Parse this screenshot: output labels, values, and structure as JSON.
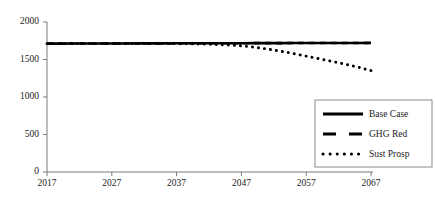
{
  "chart_data": {
    "type": "line",
    "title": "",
    "xlabel": "",
    "ylabel": "",
    "xlim": [
      2017,
      2067
    ],
    "ylim": [
      0,
      2000
    ],
    "grid": false,
    "legend_position": "bottom-right",
    "x_ticks": [
      2017,
      2027,
      2037,
      2047,
      2057,
      2067
    ],
    "x_tick_labels": [
      "2017",
      "2027",
      "2037",
      "2047",
      "2057",
      "2067"
    ],
    "y_ticks": [
      0,
      500,
      1000,
      1500,
      2000
    ],
    "y_tick_labels": [
      "0",
      "500",
      "1000",
      "1500",
      "2000"
    ],
    "x": [
      2017,
      2019,
      2021,
      2023,
      2025,
      2027,
      2029,
      2031,
      2033,
      2035,
      2037,
      2039,
      2041,
      2043,
      2045,
      2047,
      2049,
      2051,
      2053,
      2055,
      2057,
      2059,
      2061,
      2063,
      2065,
      2067
    ],
    "series": [
      {
        "name": "Base Case",
        "style": "solid",
        "color": "#000000",
        "values": [
          1712,
          1712,
          1713,
          1713,
          1714,
          1714,
          1714,
          1715,
          1715,
          1715,
          1716,
          1716,
          1716,
          1717,
          1717,
          1717,
          1718,
          1718,
          1718,
          1719,
          1719,
          1719,
          1720,
          1720,
          1720,
          1721
        ]
      },
      {
        "name": "GHG Red",
        "style": "dashed",
        "color": "#000000",
        "values": [
          1712,
          1712,
          1713,
          1713,
          1714,
          1714,
          1714,
          1715,
          1715,
          1715,
          1716,
          1716,
          1716,
          1717,
          1717,
          1717,
          1718,
          1718,
          1718,
          1719,
          1719,
          1719,
          1720,
          1720,
          1720,
          1721
        ]
      },
      {
        "name": "Sust Prosp",
        "style": "dotted",
        "color": "#000000",
        "values": [
          1711,
          1711,
          1712,
          1712,
          1712,
          1713,
          1713,
          1713,
          1713,
          1712,
          1711,
          1709,
          1706,
          1701,
          1693,
          1682,
          1664,
          1640,
          1612,
          1580,
          1545,
          1510,
          1475,
          1438,
          1398,
          1352
        ]
      }
    ]
  },
  "legend": {
    "items": [
      {
        "label": "Base Case",
        "style": "solid"
      },
      {
        "label": "GHG Red",
        "style": "dashed"
      },
      {
        "label": "Sust Prosp",
        "style": "dotted"
      }
    ]
  },
  "colors": {
    "axis": "#7a7a7a",
    "series": "#000000",
    "legend_border": "#8a8a8a",
    "text": "#1a1a1a",
    "background": "#ffffff"
  }
}
